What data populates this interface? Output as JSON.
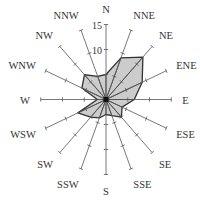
{
  "chart_data": {
    "type": "radar",
    "subtype": "wind-rose",
    "title": "",
    "categories": [
      "N",
      "NNE",
      "NE",
      "ENE",
      "E",
      "ESE",
      "SE",
      "SSE",
      "S",
      "SSW",
      "SW",
      "WSW",
      "W",
      "WNW",
      "NW",
      "NNW"
    ],
    "values": [
      5,
      9,
      12,
      9,
      6.5,
      4,
      5,
      3.5,
      3,
      4,
      5,
      7,
      2,
      6,
      7,
      5
    ],
    "radial_ticks": [
      5,
      10,
      15
    ],
    "radial_tick_labels": [
      "10",
      "15"
    ],
    "rlim": [
      0,
      15
    ],
    "fill_color": "#cccccc",
    "edge_color": "#333333",
    "axis_color": "#555555"
  }
}
